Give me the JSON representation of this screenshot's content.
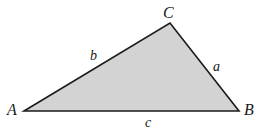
{
  "diagram": {
    "type": "triangle",
    "fill_color": "#d3d3d3",
    "stroke_color": "#1a1a1a",
    "vertices": {
      "A": {
        "label": "A",
        "x": 24,
        "y": 111
      },
      "B": {
        "label": "B",
        "x": 239,
        "y": 111
      },
      "C": {
        "label": "C",
        "x": 170,
        "y": 23
      }
    },
    "sides": {
      "a": {
        "label": "a",
        "between": [
          "B",
          "C"
        ]
      },
      "b": {
        "label": "b",
        "between": [
          "A",
          "C"
        ]
      },
      "c": {
        "label": "c",
        "between": [
          "A",
          "B"
        ]
      }
    }
  }
}
